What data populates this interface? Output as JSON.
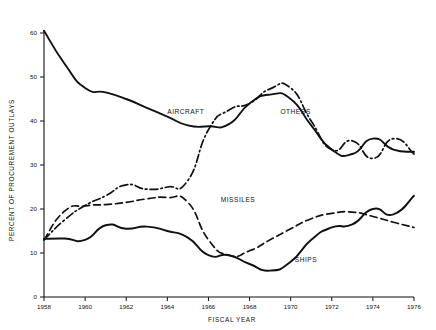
{
  "chart_data": {
    "type": "line",
    "title": "",
    "xlabel": "FISCAL YEAR",
    "ylabel": "PERCENT OF PROCUREMENT OUTLAYS",
    "xlim": [
      1958,
      1976
    ],
    "ylim": [
      0,
      62
    ],
    "grid": false,
    "legend": "inline-labels",
    "x_ticks": [
      "1958",
      "1960",
      "1962",
      "1964",
      "1966",
      "1968",
      "1970",
      "1972",
      "1974",
      "1976"
    ],
    "x_tick_values": [
      1958,
      1960,
      1962,
      1964,
      1966,
      1968,
      1970,
      1972,
      1974,
      1976
    ],
    "y_ticks": [
      "0",
      "10",
      "20",
      "30",
      "40",
      "50",
      "60"
    ],
    "y_tick_values": [
      0,
      10,
      20,
      30,
      40,
      50,
      60
    ],
    "x": [
      1958,
      1959,
      1960,
      1961,
      1962,
      1963,
      1964,
      1965,
      1966,
      1967,
      1968,
      1969,
      1970,
      1971,
      1972,
      1973,
      1974,
      1975,
      1976
    ],
    "series": [
      {
        "name": "AIRCRAFT",
        "style": "solid",
        "label": "AIRCRAFT",
        "label_x": 1964.0,
        "label_y": 41.5,
        "values": [
          60.5,
          53.0,
          47.5,
          46.5,
          45.0,
          43.0,
          41.0,
          39.0,
          38.8,
          39.3,
          44.0,
          46.0,
          45.0,
          39.0,
          33.5,
          32.5,
          36.0,
          33.5,
          33.0
        ]
      },
      {
        "name": "MISSILES",
        "style": "dashed",
        "label": "MISSILES",
        "label_x": 1966.6,
        "label_y": 21.6,
        "values": [
          13.0,
          19.5,
          20.7,
          21.0,
          21.5,
          22.3,
          22.6,
          21.5,
          13.0,
          9.5,
          10.5,
          13.0,
          15.5,
          17.8,
          19.0,
          19.3,
          18.3,
          17.0,
          15.8
        ]
      },
      {
        "name": "OTHERS",
        "style": "dashdot",
        "label": "OTHERS",
        "label_x": 1969.5,
        "label_y": 41.5,
        "values": [
          13.0,
          17.5,
          20.8,
          23.0,
          25.5,
          24.5,
          25.0,
          26.5,
          38.0,
          42.5,
          44.0,
          47.3,
          47.5,
          40.0,
          33.5,
          35.5,
          31.5,
          36.0,
          32.5
        ]
      },
      {
        "name": "SHIPS",
        "style": "solid",
        "label": "SHIPS",
        "label_x": 1970.2,
        "label_y": 8.0,
        "values": [
          13.2,
          13.3,
          13.0,
          16.3,
          15.5,
          16.0,
          15.0,
          13.5,
          9.5,
          9.5,
          7.5,
          6.0,
          8.0,
          13.0,
          15.8,
          16.5,
          20.0,
          18.8,
          23.0
        ]
      }
    ]
  }
}
